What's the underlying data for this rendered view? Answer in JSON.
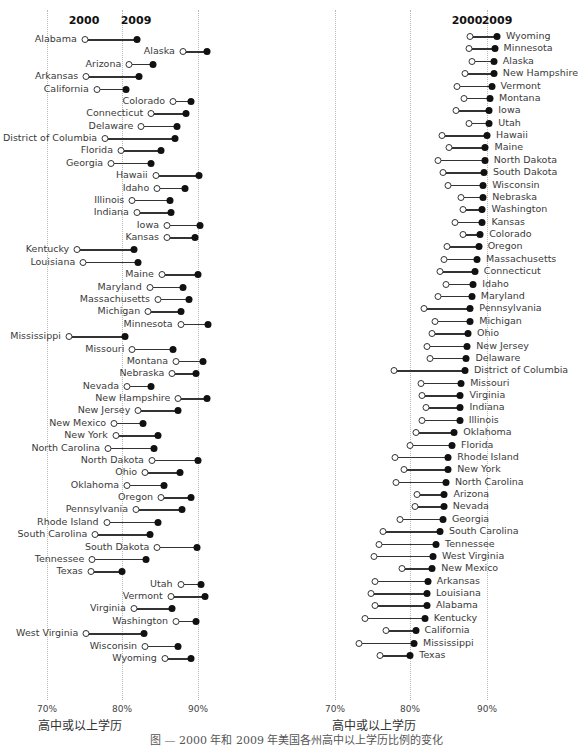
{
  "caption": "图 — 2000 年和 2009 年美国各州高中以上学历比例的变化",
  "chart_data": [
    {
      "type": "dumbbell",
      "title": "",
      "sort": "alphabetical",
      "legend": [
        "2000",
        "2009"
      ],
      "legend_markers": {
        "2000": "open circle",
        "2009": "filled circle"
      },
      "xlabel": "高中或以上学历",
      "ylabel": "",
      "x_ticks": [
        "70%",
        "80%",
        "90%"
      ],
      "xlim": [
        66,
        94
      ],
      "grid": "vertical dotted",
      "categories": [
        "Alabama",
        "Alaska",
        "Arizona",
        "Arkansas",
        "California",
        "Colorado",
        "Connecticut",
        "Delaware",
        "District of Columbia",
        "Florida",
        "Georgia",
        "Hawaii",
        "Idaho",
        "Illinois",
        "Indiana",
        "Iowa",
        "Kansas",
        "Kentucky",
        "Louisiana",
        "Maine",
        "Maryland",
        "Massachusetts",
        "Michigan",
        "Minnesota",
        "Mississippi",
        "Missouri",
        "Montana",
        "Nebraska",
        "Nevada",
        "New Hampshire",
        "New Jersey",
        "New Mexico",
        "New York",
        "North Carolina",
        "North Dakota",
        "Ohio",
        "Oklahoma",
        "Oregon",
        "Pennsylvania",
        "Rhode Island",
        "South Carolina",
        "South Dakota",
        "Tennessee",
        "Texas",
        "Utah",
        "Vermont",
        "Virginia",
        "Washington",
        "West Virginia",
        "Wisconsin",
        "Wyoming"
      ],
      "series": [
        {
          "name": "2000",
          "values": [
            75.0,
            88.0,
            80.9,
            75.2,
            76.6,
            86.7,
            83.8,
            82.5,
            77.7,
            79.8,
            78.5,
            84.4,
            84.6,
            81.3,
            81.9,
            85.9,
            85.9,
            74.0,
            74.8,
            85.2,
            83.6,
            84.7,
            83.4,
            87.7,
            72.9,
            81.3,
            87.1,
            86.6,
            80.6,
            87.4,
            82.1,
            78.9,
            79.1,
            78.1,
            83.9,
            83.0,
            80.6,
            85.1,
            81.8,
            77.9,
            76.4,
            84.6,
            76.0,
            75.8,
            87.7,
            86.4,
            81.5,
            87.1,
            75.2,
            83.0,
            85.6
          ]
        },
        {
          "name": "2009",
          "values": [
            81.9,
            91.2,
            84.0,
            82.2,
            80.5,
            89.1,
            88.4,
            87.2,
            87.0,
            85.1,
            83.8,
            90.1,
            88.3,
            86.3,
            86.4,
            90.3,
            89.6,
            81.5,
            82.1,
            90.0,
            88.0,
            88.8,
            87.7,
            91.3,
            80.3,
            86.7,
            90.7,
            89.7,
            83.8,
            91.2,
            87.4,
            82.7,
            84.7,
            84.2,
            90.0,
            87.6,
            85.5,
            89.1,
            87.9,
            84.7,
            83.6,
            89.9,
            83.1,
            79.9,
            90.4,
            90.9,
            86.6,
            89.7,
            82.8,
            87.4,
            89.1
          ]
        }
      ]
    },
    {
      "type": "dumbbell",
      "title": "",
      "sort": "descending by 2009",
      "legend": [
        "2000",
        "2009"
      ],
      "legend_markers": {
        "2000": "open circle",
        "2009": "filled circle"
      },
      "xlabel": "高中或以上学历",
      "ylabel": "",
      "x_ticks": [
        "70%",
        "80%",
        "90%"
      ],
      "xlim": [
        66,
        94
      ],
      "grid": "vertical dotted",
      "categories": [
        "Wyoming",
        "Minnesota",
        "Alaska",
        "New Hampshire",
        "Vermont",
        "Montana",
        "Iowa",
        "Utah",
        "Hawaii",
        "Maine",
        "North Dakota",
        "South Dakota",
        "Wisconsin",
        "Nebraska",
        "Washington",
        "Kansas",
        "Colorado",
        "Oregon",
        "Massachusetts",
        "Connecticut",
        "Idaho",
        "Maryland",
        "Pennsylvania",
        "Michigan",
        "Ohio",
        "New Jersey",
        "Delaware",
        "District of Columbia",
        "Missouri",
        "Virginia",
        "Indiana",
        "Illinois",
        "Oklahoma",
        "Florida",
        "Rhode Island",
        "New York",
        "North Carolina",
        "Arizona",
        "Nevada",
        "Georgia",
        "South Carolina",
        "Tennessee",
        "West Virginia",
        "New Mexico",
        "Arkansas",
        "Louisiana",
        "Alabama",
        "Kentucky",
        "California",
        "Mississippi",
        "Texas"
      ],
      "series": [
        {
          "name": "2000",
          "values": [
            87.7,
            87.6,
            88.0,
            87.1,
            86.1,
            87.0,
            85.9,
            87.6,
            84.1,
            85.0,
            83.6,
            84.2,
            84.9,
            86.6,
            86.9,
            85.8,
            86.9,
            84.8,
            84.4,
            83.8,
            84.6,
            83.6,
            81.7,
            83.1,
            82.7,
            82.1,
            82.5,
            77.7,
            81.3,
            81.4,
            82.0,
            81.4,
            80.6,
            79.9,
            77.9,
            79.1,
            78.0,
            80.8,
            80.5,
            78.5,
            76.3,
            75.8,
            75.1,
            78.8,
            75.3,
            74.8,
            75.3,
            74.0,
            76.7,
            73.1,
            75.9
          ]
        },
        {
          "name": "2009",
          "values": [
            91.3,
            91.0,
            90.9,
            90.9,
            90.6,
            90.4,
            90.3,
            90.3,
            90.0,
            89.8,
            89.7,
            89.6,
            89.5,
            89.5,
            89.4,
            89.4,
            89.1,
            88.9,
            88.7,
            88.4,
            88.2,
            88.0,
            87.8,
            87.8,
            87.5,
            87.4,
            87.3,
            87.1,
            86.6,
            86.5,
            86.5,
            86.4,
            85.7,
            85.4,
            84.9,
            84.9,
            84.6,
            84.4,
            84.3,
            84.2,
            83.8,
            83.3,
            82.9,
            82.8,
            82.2,
            82.1,
            82.1,
            81.8,
            80.6,
            80.4,
            79.9
          ]
        }
      ]
    }
  ],
  "left_panel": {
    "header_2000": "2000",
    "header_2009": "2009",
    "tick_70": "70%",
    "tick_80": "80%",
    "tick_90": "90%",
    "axis_title": "高中或以上学历"
  },
  "right_panel": {
    "header_2000": "2000",
    "header_2009": "2009",
    "tick_70": "70%",
    "tick_80": "80%",
    "tick_90": "90%",
    "axis_title": "高中或以上学历"
  }
}
